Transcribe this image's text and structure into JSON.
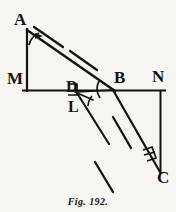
{
  "figure": {
    "caption": "Fig. 192.",
    "ink_color": "#15110e",
    "background_color": "#f7f5f2",
    "labels": {
      "a": "A",
      "m": "M",
      "d": "D",
      "l": "L",
      "b": "B",
      "n": "N",
      "c": "C"
    },
    "marks": {
      "right_angle_at_d": "right-angle-square",
      "right_angle_at_c": "right-angle-square",
      "arc_at_a": "angle-arc-with-arrow",
      "arc_at_b": "angle-arc",
      "arc_at_l": "angle-arc"
    },
    "geometry": {
      "points": {
        "A": [
          27,
          29
        ],
        "M": [
          27,
          90
        ],
        "D": [
          74,
          90
        ],
        "L": [
          76,
          93
        ],
        "B": [
          113,
          90
        ],
        "N": [
          160,
          90
        ],
        "C": [
          160,
          172
        ]
      },
      "solid_segments": [
        [
          "M",
          "N"
        ],
        [
          "A",
          "M"
        ],
        [
          "A",
          "B"
        ],
        [
          "B",
          "C"
        ],
        [
          "N",
          "C"
        ],
        [
          "L",
          "ray-down"
        ]
      ],
      "dashed_segments": [
        [
          "A-parallel-ray"
        ],
        [
          "L-extension-ray"
        ],
        [
          "B-C-parallel-ray"
        ]
      ]
    }
  }
}
